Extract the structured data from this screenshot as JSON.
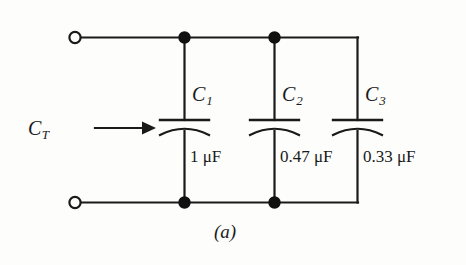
{
  "figure": {
    "caption": "(a)",
    "background_color": "#fdfdfc",
    "ink_color": "#1a1a1a",
    "total_label": {
      "symbol": "C",
      "subscript": "T",
      "arrow": "right-arrow"
    },
    "terminals": [
      {
        "name": "top-left-terminal",
        "type": "open-circle"
      },
      {
        "name": "bottom-left-terminal",
        "type": "open-circle"
      }
    ],
    "junction_dots": [
      {
        "name": "top-node-c1"
      },
      {
        "name": "top-node-c2"
      },
      {
        "name": "bottom-node-c1"
      },
      {
        "name": "bottom-node-c2"
      }
    ],
    "components": [
      {
        "symbol": "C",
        "subscript": "1",
        "value": "1 μF",
        "type": "capacitor",
        "connection": "parallel"
      },
      {
        "symbol": "C",
        "subscript": "2",
        "value": "0.47 μF",
        "type": "capacitor",
        "connection": "parallel"
      },
      {
        "symbol": "C",
        "subscript": "3",
        "value": "0.33 μF",
        "type": "capacitor",
        "connection": "parallel"
      }
    ]
  }
}
